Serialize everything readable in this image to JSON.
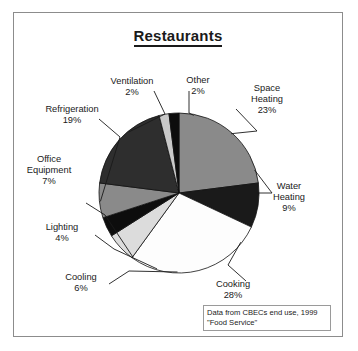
{
  "chart_data": {
    "type": "pie",
    "title": "Restaurants",
    "xlabel": "",
    "ylabel": "",
    "units": "percent",
    "start_angle_deg": 0,
    "direction": "clockwise",
    "categories": [
      "Space Heating",
      "Water Heating",
      "Cooking",
      "Cooling",
      "Lighting",
      "Office Equipment",
      "Refrigeration",
      "Ventilation",
      "Other"
    ],
    "values": [
      23,
      9,
      28,
      6,
      4,
      7,
      19,
      2,
      2
    ],
    "slice_colors": [
      "#8a8a8a",
      "#1a1a1a",
      "#fdfdfd",
      "#dcdcdc",
      "#0d0d0d",
      "#8a8a8a",
      "#2e2e2e",
      "#c9c9c9",
      "#0d0d0d"
    ],
    "labels": [
      {
        "name": "Space Heating",
        "name_line1": "Space",
        "name_line2": "Heating",
        "value_text": "23%"
      },
      {
        "name": "Water Heating",
        "name_line1": "Water",
        "name_line2": "Heating",
        "value_text": "9%"
      },
      {
        "name": "Cooking",
        "name_line1": "Cooking",
        "name_line2": "",
        "value_text": "28%"
      },
      {
        "name": "Cooling",
        "name_line1": "Cooling",
        "name_line2": "",
        "value_text": "6%"
      },
      {
        "name": "Lighting",
        "name_line1": "Lighting",
        "name_line2": "",
        "value_text": "4%"
      },
      {
        "name": "Office Equipment",
        "name_line1": "Office",
        "name_line2": "Equipment",
        "value_text": "7%"
      },
      {
        "name": "Refrigeration",
        "name_line1": "Refrigeration",
        "name_line2": "",
        "value_text": "19%"
      },
      {
        "name": "Ventilation",
        "name_line1": "Ventilation",
        "name_line2": "",
        "value_text": "2%"
      },
      {
        "name": "Other",
        "name_line1": "Other",
        "name_line2": "",
        "value_text": "2%"
      }
    ],
    "legend": "none",
    "grid": false,
    "source_note_line1": "Data from CBECs end use, 1999",
    "source_note_line2": "\"Food Service\""
  }
}
